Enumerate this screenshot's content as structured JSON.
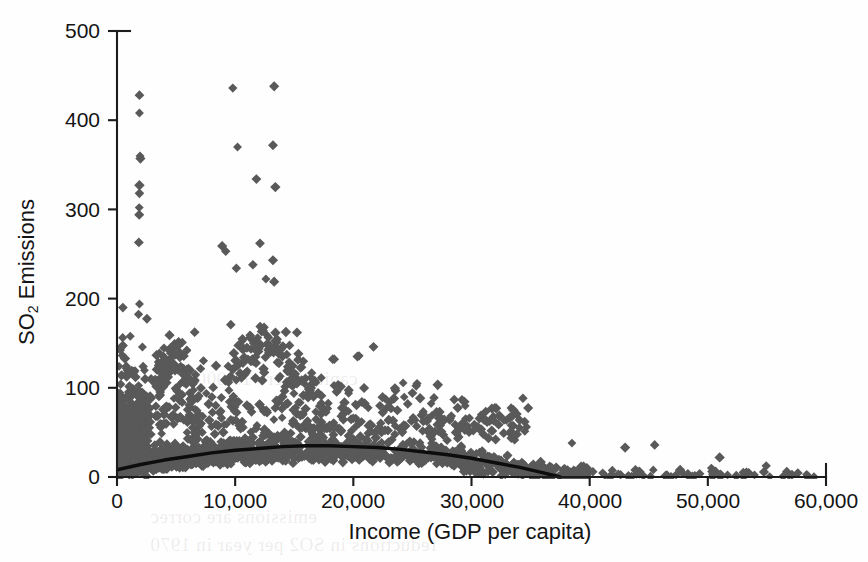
{
  "figure": {
    "background_color": "#fefefe",
    "marker_color": "#595959",
    "curve_color": "#0d0d0d",
    "axis_color": "#1c1c1c"
  },
  "axis": {
    "y_title_main": "SO",
    "y_title_sub": "2",
    "y_title_rest": " Emissions",
    "x_title": "Income (GDP per capita)",
    "y_ticks": [
      "0",
      "100",
      "200",
      "300",
      "400",
      "500"
    ],
    "x_ticks": [
      "0",
      "10,000",
      "20,000",
      "30,000",
      "40,000",
      "50,000",
      "60,000"
    ]
  },
  "bleed_text": [
    {
      "text": "capita) were 15,000",
      "left": 196,
      "top": 368
    },
    {
      "text": "emissions are correc",
      "left": 150,
      "top": 506
    },
    {
      "text": "reductions in SO2 per year in 1970",
      "left": 150,
      "top": 534
    }
  ],
  "chart_data": {
    "type": "scatter",
    "title": "",
    "xlabel": "Income (GDP per capita)",
    "ylabel": "SO2 Emissions",
    "xlim": [
      0,
      60000
    ],
    "ylim": [
      0,
      500
    ],
    "xticks": [
      0,
      10000,
      20000,
      30000,
      40000,
      50000,
      60000
    ],
    "yticks": [
      0,
      100,
      200,
      300,
      400,
      500
    ],
    "grid": false,
    "legend": null,
    "marker": "diamond",
    "marker_color": "#595959",
    "fit_curve": {
      "name": "Fitted quadratic trend",
      "color": "#0d0d0d",
      "shape": "inverted-u",
      "peak_x": 17000,
      "peak_y": 35,
      "points": [
        [
          0,
          8
        ],
        [
          2000,
          14
        ],
        [
          4000,
          19
        ],
        [
          6000,
          23
        ],
        [
          8000,
          27
        ],
        [
          10000,
          30
        ],
        [
          12000,
          32
        ],
        [
          14000,
          34
        ],
        [
          16000,
          35
        ],
        [
          17000,
          35
        ],
        [
          18000,
          35
        ],
        [
          20000,
          34
        ],
        [
          22000,
          33
        ],
        [
          24000,
          31
        ],
        [
          26000,
          28
        ],
        [
          28000,
          25
        ],
        [
          30000,
          21
        ],
        [
          32000,
          16
        ],
        [
          34000,
          11
        ],
        [
          36000,
          5
        ],
        [
          37500,
          0
        ]
      ]
    },
    "notable_outliers": [
      {
        "x": 1900,
        "y": 428
      },
      {
        "x": 1900,
        "y": 408
      },
      {
        "x": 1950,
        "y": 360
      },
      {
        "x": 1980,
        "y": 357
      },
      {
        "x": 1900,
        "y": 327
      },
      {
        "x": 1900,
        "y": 318
      },
      {
        "x": 1880,
        "y": 302
      },
      {
        "x": 1880,
        "y": 294
      },
      {
        "x": 1850,
        "y": 263
      },
      {
        "x": 1900,
        "y": 194
      },
      {
        "x": 9800,
        "y": 436
      },
      {
        "x": 13300,
        "y": 438
      },
      {
        "x": 10200,
        "y": 370
      },
      {
        "x": 13200,
        "y": 372
      },
      {
        "x": 11800,
        "y": 334
      },
      {
        "x": 13400,
        "y": 325
      },
      {
        "x": 8900,
        "y": 259
      },
      {
        "x": 9200,
        "y": 253
      },
      {
        "x": 12100,
        "y": 262
      },
      {
        "x": 10100,
        "y": 234
      },
      {
        "x": 11500,
        "y": 238
      },
      {
        "x": 13200,
        "y": 243
      },
      {
        "x": 12600,
        "y": 222
      },
      {
        "x": 13300,
        "y": 219
      },
      {
        "x": 34500,
        "y": 62
      },
      {
        "x": 38500,
        "y": 38
      },
      {
        "x": 45500,
        "y": 36
      },
      {
        "x": 43000,
        "y": 33
      },
      {
        "x": 51000,
        "y": 22
      },
      {
        "x": 53000,
        "y": 5
      },
      {
        "x": 29500,
        "y": 54
      },
      {
        "x": 31000,
        "y": 48
      }
    ],
    "series": [
      {
        "name": "Country-year observations",
        "n_points_approx": 2600,
        "density_note": "Saturated mass below SO2=40 for income 0-35,000; tail thins beyond 38,000."
      }
    ]
  }
}
